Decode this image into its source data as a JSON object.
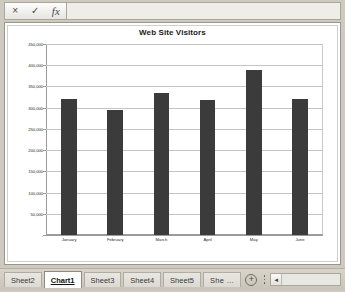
{
  "formula_bar": {
    "cancel_icon": "×",
    "accept_icon": "✓",
    "function_icon": "fx",
    "value": "",
    "placeholder": ""
  },
  "chart": {
    "title": "Web Site Visitors"
  },
  "chart_data": {
    "type": "bar",
    "title": "Web Site Visitors",
    "xlabel": "",
    "ylabel": "",
    "categories": [
      "January",
      "February",
      "March",
      "April",
      "May",
      "June"
    ],
    "values": [
      320000,
      295000,
      335000,
      318000,
      388000,
      320000
    ],
    "ylim": [
      0,
      450000
    ],
    "ytick_labels": [
      "450,000",
      "400,000",
      "350,000",
      "300,000",
      "250,000",
      "200,000",
      "150,000",
      "100,000",
      "50,000",
      "-"
    ],
    "ytick_values": [
      450000,
      400000,
      350000,
      300000,
      250000,
      200000,
      150000,
      100000,
      50000,
      0
    ],
    "grid": true,
    "legend": "none",
    "bar_color": "#3b3b3b"
  },
  "tabs": {
    "items": [
      {
        "label": "Sheet2",
        "active": false
      },
      {
        "label": "Chart1",
        "active": true
      },
      {
        "label": "Sheet3",
        "active": false
      },
      {
        "label": "Sheet4",
        "active": false
      },
      {
        "label": "Sheet5",
        "active": false
      },
      {
        "label": "She …",
        "active": false
      }
    ],
    "add_label": "+",
    "scroll_left_icon": "◄"
  }
}
